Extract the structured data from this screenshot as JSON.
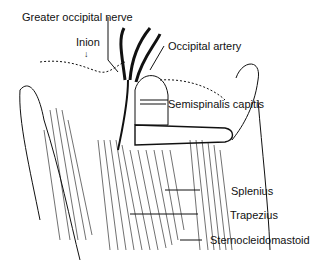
{
  "figure": {
    "type": "anatomical-illustration"
  },
  "labels": {
    "greater_occipital_nerve": "Greater occipital nerve",
    "inion": "Inion",
    "inion_arrow": "↓",
    "occipital_artery": "Occipital artery",
    "semispinalis_capitis": "Semispinalis capitis",
    "splenius": "Splenius",
    "trapezius": "Trapezius",
    "sternocleidomastoid": "Sternocleidomastoid"
  },
  "colors": {
    "ink": "#111111",
    "background": "#ffffff"
  }
}
